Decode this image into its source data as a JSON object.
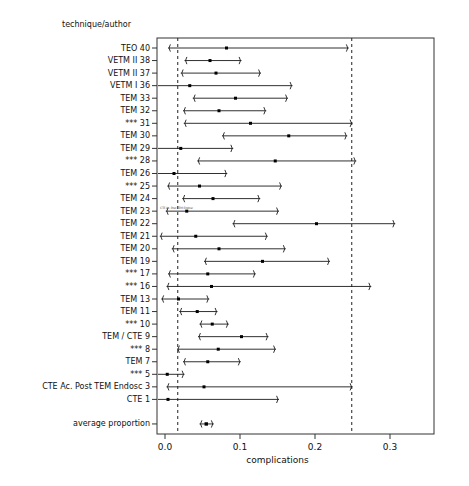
{
  "header": {
    "column_title": "technique/author"
  },
  "axis": {
    "xlabel": "complications",
    "ticks": [
      "0.0",
      "0.1",
      "0.2",
      "0.3"
    ],
    "tick_values": [
      0.0,
      0.1,
      0.2,
      0.3
    ],
    "xlim": [
      -0.012,
      0.405
    ],
    "reference_lines": [
      0.017,
      0.249
    ]
  },
  "artifact_text": "CTE Ac. Post TEM Endosc",
  "chart_data": {
    "type": "forest",
    "title": "",
    "xlabel": "complications",
    "ylabel": "technique/author",
    "xlim": [
      -0.012,
      0.405
    ],
    "ticks": [
      0.0,
      0.1,
      0.2,
      0.3
    ],
    "grid": false,
    "legend": "none",
    "reference_lines": [
      0.017,
      0.249
    ],
    "categories": [
      "TEO 40",
      "VETM II 38",
      "VETM II 37",
      "VETM I 36",
      "TEM 33",
      "TEM 32",
      "*** 31",
      "TEM 30",
      "TEM 29",
      "*** 28",
      "TEM 26",
      "*** 25",
      "TEM 24",
      "TEM 23",
      "TEM 22",
      "TEM 21",
      "TEM 20",
      "TEM 19",
      "*** 17",
      "*** 16",
      "TEM 13",
      "TEM 11",
      "*** 10",
      "TEM / CTE 9",
      "*** 8",
      "TEM 7",
      "*** 5",
      "CTE Ac. Post TEM Endosc 3",
      "CTE 1",
      "average proportion"
    ],
    "series": [
      {
        "name": "proportion with 95% CI",
        "points": [
          {
            "label": "TEO 40",
            "estimate": 0.082,
            "lower": 0.004,
            "upper": 0.245
          },
          {
            "label": "VETM II 38",
            "estimate": 0.06,
            "lower": 0.026,
            "upper": 0.102
          },
          {
            "label": "VETM II 37",
            "estimate": 0.068,
            "lower": 0.021,
            "upper": 0.128
          },
          {
            "label": "VETM I 36",
            "estimate": 0.033,
            "lower": -0.01,
            "upper": 0.17
          },
          {
            "label": "TEM 33",
            "estimate": 0.094,
            "lower": 0.037,
            "upper": 0.164
          },
          {
            "label": "TEM 32",
            "estimate": 0.072,
            "lower": 0.024,
            "upper": 0.135
          },
          {
            "label": "*** 31",
            "estimate": 0.114,
            "lower": 0.025,
            "upper": 0.25
          },
          {
            "label": "TEM 30",
            "estimate": 0.165,
            "lower": 0.076,
            "upper": 0.243
          },
          {
            "label": "TEM 29",
            "estimate": 0.021,
            "lower": -0.01,
            "upper": 0.091
          },
          {
            "label": "*** 28",
            "estimate": 0.147,
            "lower": 0.043,
            "upper": 0.255
          },
          {
            "label": "TEM 26",
            "estimate": 0.012,
            "lower": -0.01,
            "upper": 0.083
          },
          {
            "label": "*** 25",
            "estimate": 0.046,
            "lower": 0.003,
            "upper": 0.156
          },
          {
            "label": "TEM 24",
            "estimate": 0.064,
            "lower": 0.023,
            "upper": 0.127
          },
          {
            "label": "TEM 23",
            "estimate": 0.029,
            "lower": 0.001,
            "upper": 0.152
          },
          {
            "label": "TEM 22",
            "estimate": 0.202,
            "lower": 0.09,
            "upper": 0.307
          },
          {
            "label": "TEM 21",
            "estimate": 0.041,
            "lower": -0.007,
            "upper": 0.137
          },
          {
            "label": "TEM 20",
            "estimate": 0.072,
            "lower": 0.009,
            "upper": 0.161
          },
          {
            "label": "TEM 19",
            "estimate": 0.13,
            "lower": 0.052,
            "upper": 0.22
          },
          {
            "label": "*** 17",
            "estimate": 0.057,
            "lower": 0.004,
            "upper": 0.121
          },
          {
            "label": "*** 16",
            "estimate": 0.062,
            "lower": 0.002,
            "upper": 0.275
          },
          {
            "label": "TEM 13",
            "estimate": 0.018,
            "lower": -0.005,
            "upper": 0.059
          },
          {
            "label": "TEM 11",
            "estimate": 0.043,
            "lower": 0.019,
            "upper": 0.07
          },
          {
            "label": "*** 10",
            "estimate": 0.063,
            "lower": 0.046,
            "upper": 0.085
          },
          {
            "label": "TEM / CTE 9",
            "estimate": 0.102,
            "lower": 0.044,
            "upper": 0.138
          },
          {
            "label": "*** 8",
            "estimate": 0.071,
            "lower": 0.016,
            "upper": 0.148
          },
          {
            "label": "TEM 7",
            "estimate": 0.057,
            "lower": 0.024,
            "upper": 0.101
          },
          {
            "label": "*** 5",
            "estimate": 0.003,
            "lower": -0.01,
            "upper": 0.026
          },
          {
            "label": "CTE Ac. Post TEM Endosc 3",
            "estimate": 0.052,
            "lower": 0.002,
            "upper": 0.25
          },
          {
            "label": "CTE 1",
            "estimate": 0.004,
            "lower": -0.01,
            "upper": 0.152
          },
          {
            "label": "average proportion",
            "estimate": 0.055,
            "lower": 0.046,
            "upper": 0.065
          }
        ]
      }
    ]
  }
}
